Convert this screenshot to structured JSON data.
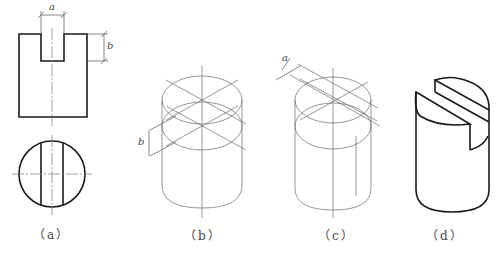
{
  "figures": [
    {
      "id": "a",
      "caption": "（a）",
      "description": "Orthographic front and top views of cylinder with slot"
    },
    {
      "id": "b",
      "caption": "（b）",
      "description": "Isometric construction step showing slot depth b"
    },
    {
      "id": "c",
      "caption": "（c）",
      "description": "Isometric construction step showing slot width a"
    },
    {
      "id": "d",
      "caption": "（d）",
      "description": "Finished isometric view of slotted cylinder"
    }
  ],
  "dimensions": {
    "a_fig_a": "a",
    "b_fig_a": "b",
    "b_fig_b": "b",
    "a_fig_c": "a"
  },
  "colors": {
    "outline": "#1a1a1a",
    "construction": "#6a6a6a",
    "background": "#ffffff"
  }
}
